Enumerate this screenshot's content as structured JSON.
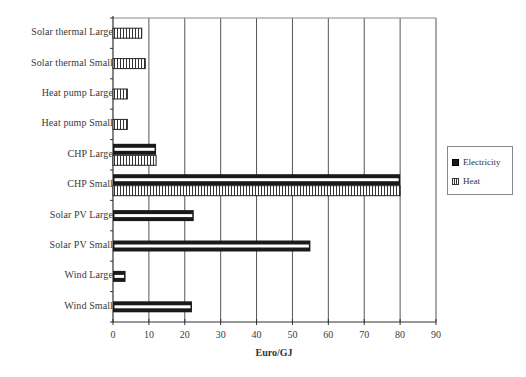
{
  "chart_data": {
    "type": "bar",
    "orientation": "horizontal",
    "title": "",
    "xlabel": "Euro/GJ",
    "ylabel": "",
    "xlim": [
      0,
      90
    ],
    "xticks": [
      0,
      10,
      20,
      30,
      40,
      50,
      60,
      70,
      80,
      90
    ],
    "grid": "vertical",
    "legend_position": "right",
    "categories": [
      "Solar thermal Large",
      "Solar thermal Small",
      "Heat pump Large",
      "Heat pump Small",
      "CHP Large",
      "CHP Small",
      "Solar PV Large",
      "Solar PV Small",
      "Wind Large",
      "Wind Small"
    ],
    "series": [
      {
        "name": "Electricity",
        "values": [
          null,
          null,
          null,
          null,
          12,
          80,
          22.5,
          55,
          3.5,
          22
        ]
      },
      {
        "name": "Heat",
        "values": [
          8,
          9,
          4,
          4,
          12,
          80,
          null,
          null,
          null,
          null
        ]
      }
    ]
  },
  "legend": {
    "items": [
      {
        "label": "Electricity"
      },
      {
        "label": "Heat"
      }
    ]
  },
  "colors": {
    "electricity_fill": "#1a1a1a",
    "heat_hatch": "#333333",
    "grid": "#555555",
    "axis": "#333333"
  }
}
